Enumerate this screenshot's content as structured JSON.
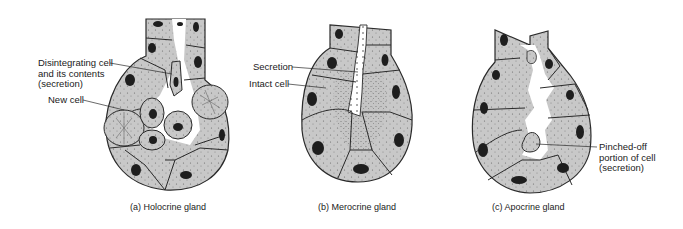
{
  "figure": {
    "panels": [
      {
        "id": "a",
        "caption": "(a)  Holocrine gland",
        "labels": [
          {
            "text": "Disintegrating cell\nand its contents\n(secretion)"
          },
          {
            "text": "New cell"
          }
        ]
      },
      {
        "id": "b",
        "caption": "(b)  Merocrine gland",
        "labels": [
          {
            "text": "Secretion"
          },
          {
            "text": "Intact cell"
          }
        ]
      },
      {
        "id": "c",
        "caption": "(c)  Apocrine gland",
        "labels": [
          {
            "text": "Pinched-off\nportion of cell\n(secretion)"
          }
        ]
      }
    ],
    "colors": {
      "cell_fill": "#c9c9c9",
      "outline": "#2a2a2a",
      "nucleus": "#1e1e1e",
      "background": "#ffffff"
    }
  }
}
